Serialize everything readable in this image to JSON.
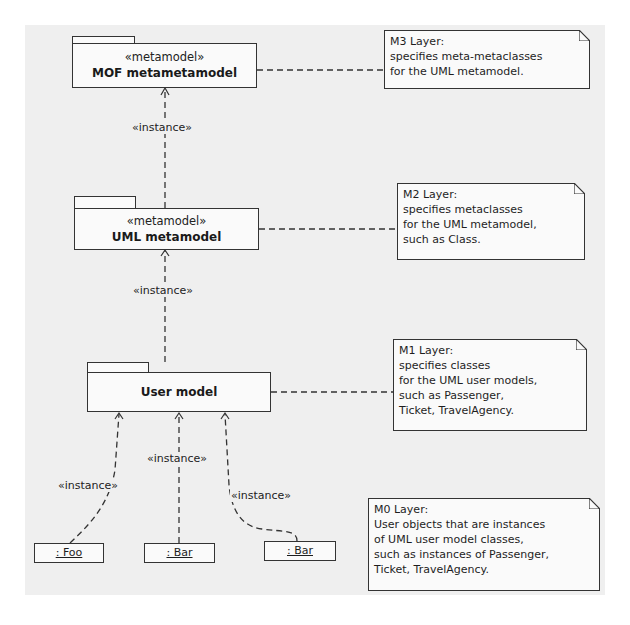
{
  "diagram": {
    "type": "UML four-layer metamodel hierarchy",
    "packages": [
      {
        "id": "mof",
        "stereotype": "«metamodel»",
        "name": "MOF metametamodel"
      },
      {
        "id": "uml",
        "stereotype": "«metamodel»",
        "name": "UML metamodel"
      },
      {
        "id": "user",
        "stereotype": "",
        "name": "User model"
      }
    ],
    "notes": [
      {
        "id": "m3",
        "lines": [
          "M3 Layer:",
          "specifies meta-metaclasses",
          "for the UML metamodel."
        ]
      },
      {
        "id": "m2",
        "lines": [
          "M2 Layer:",
          "specifies metaclasses",
          "for the UML metamodel,",
          "such as Class."
        ]
      },
      {
        "id": "m1",
        "lines": [
          "M1 Layer:",
          "specifies classes",
          "for the UML user models,",
          "such as Passenger,",
          "Ticket, TravelAgency."
        ]
      },
      {
        "id": "m0",
        "lines": [
          "M0 Layer:",
          "User objects that are instances",
          "of UML user model classes,",
          "such as instances of Passenger,",
          "Ticket, TravelAgency."
        ]
      }
    ],
    "objects": [
      {
        "id": "foo",
        "label": ": Foo"
      },
      {
        "id": "bar1",
        "label": ": Bar"
      },
      {
        "id": "bar2",
        "label": ": Bar"
      }
    ],
    "edges": [
      {
        "from": "uml",
        "to": "mof",
        "label": "«instance»"
      },
      {
        "from": "user",
        "to": "uml",
        "label": "«instance»"
      },
      {
        "from": "foo",
        "to": "user",
        "label": "«instance»"
      },
      {
        "from": "bar1",
        "to": "user",
        "label": "«instance»"
      },
      {
        "from": "bar2",
        "to": "user",
        "label": "«instance»"
      }
    ]
  }
}
